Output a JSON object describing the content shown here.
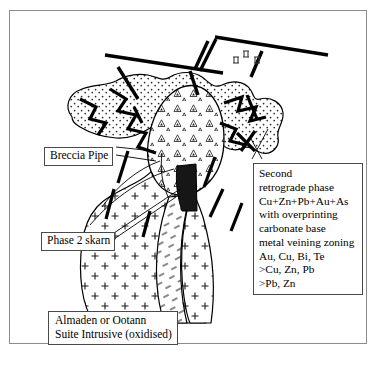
{
  "figure": {
    "frame_color": "#8c8c8c",
    "background": "#ffffff",
    "line_color": "#000000"
  },
  "callouts": {
    "breccia_pipe": {
      "label": "Breccia Pipe"
    },
    "phase_2_skarn": {
      "label": "Phase 2 skarn"
    },
    "intrusive": {
      "label": "Almaden or Ootann\nSuite Intrusive (oxidised)"
    },
    "second_retrograde": {
      "label": "Second\nretrograde phase\nCu+Zn+Pb+Au+As\nwith overprinting\ncarbonate base\nmetal veining zoning\nAu, Cu, Bi, Te\n>Cu, Zn, Pb\n>Pb, Zn"
    }
  },
  "map_symbols": {
    "bedding_marks": "II II II"
  },
  "legend_units": [
    {
      "name": "stippled-host-rock",
      "pattern": "dots"
    },
    {
      "name": "breccia-pipe-body",
      "pattern": "triangles"
    },
    {
      "name": "intrusive-body",
      "pattern": "crosses"
    },
    {
      "name": "phase-2-skarn-band",
      "pattern": "dashes"
    },
    {
      "name": "massive-sulphide-lens",
      "pattern": "solid-black"
    },
    {
      "name": "veins-faults",
      "pattern": "thick-lines"
    }
  ]
}
